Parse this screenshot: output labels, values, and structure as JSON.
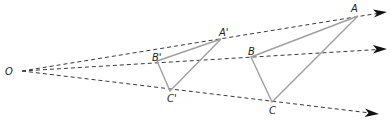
{
  "diagram": {
    "center": {
      "label": "O",
      "x": 18,
      "y": 71
    },
    "rays": [
      {
        "name": "ray-through-A",
        "from": [
          22,
          71
        ],
        "to": [
          386,
          12
        ]
      },
      {
        "name": "ray-through-B",
        "from": [
          22,
          71
        ],
        "to": [
          386,
          49
        ]
      },
      {
        "name": "ray-through-C",
        "from": [
          22,
          71
        ],
        "to": [
          378,
          114
        ]
      }
    ],
    "image_triangle": {
      "vertices": [
        {
          "label": "A'",
          "x": 221,
          "y": 39
        },
        {
          "label": "B'",
          "x": 157,
          "y": 61
        },
        {
          "label": "C'",
          "x": 170,
          "y": 91
        }
      ]
    },
    "original_triangle": {
      "vertices": [
        {
          "label": "A",
          "x": 358,
          "y": 16
        },
        {
          "label": "B",
          "x": 251,
          "y": 57
        },
        {
          "label": "C",
          "x": 272,
          "y": 102
        }
      ]
    },
    "labels": {
      "O": "O",
      "A": "A",
      "B": "B",
      "C": "C",
      "A_prime": "A'",
      "B_prime": "B'",
      "C_prime": "C'"
    },
    "colors": {
      "ray": "#3a3a3a",
      "triangle_edge": "#a0a0a0",
      "label": "#222222",
      "arrowhead": "#111111"
    }
  }
}
